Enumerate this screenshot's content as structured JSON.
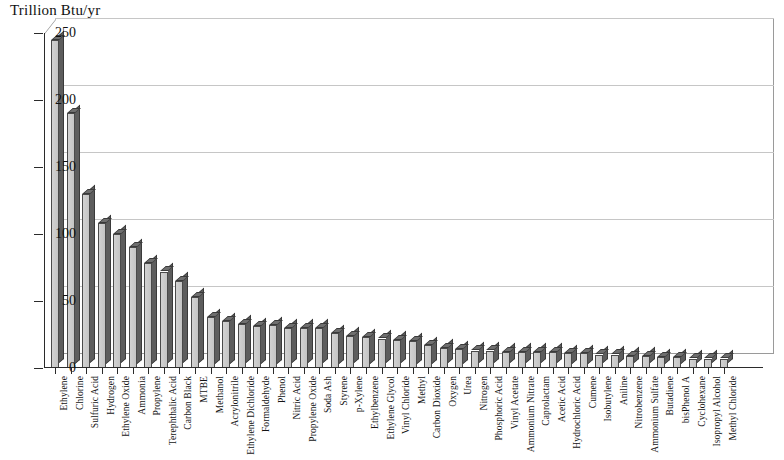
{
  "chart_data": {
    "type": "bar",
    "title": "",
    "ylabel": "Trillion Btu/yr",
    "xlabel": "",
    "ylim": [
      0,
      250
    ],
    "yticks": [
      0,
      50,
      100,
      150,
      200,
      250
    ],
    "grid": true,
    "legend": "none",
    "categories": [
      "Ethylene",
      "Chlorine",
      "Sulfuric Acid",
      "Hydrogen",
      "Ethylene Oxide",
      "Ammonia",
      "Propylene",
      "Terephthalic Acid",
      "Carbon Black",
      "MTBE",
      "Methanol",
      "Acrylonitrile",
      "Ethylene Dichloride",
      "Formaldehyde",
      "Phenol",
      "Nitric Acid",
      "Propylene Oxide",
      "Soda Ash",
      "Styrene",
      "p-Xylene",
      "Ethylbenzene",
      "Ethylene Glycol",
      "Vinyl Chloride",
      "Methyl",
      "Carbon Dioxide",
      "Oxygen",
      "Urea",
      "Nitrogen",
      "Phosphoric Acid",
      "Vinyl Acetate",
      "Ammonium Nitrate",
      "Caprolactam",
      "Acetic Acid",
      "Hydrochloric Acid",
      "Cumene",
      "Isobutylene",
      "Aniline",
      "Nitrobenzene",
      "Ammonium Sulfate",
      "Butadiene",
      "bisPhenol A",
      "Cyclohexane",
      "Isopropyl Alcohol",
      "Methyl Chloride"
    ],
    "values": [
      245,
      190,
      130,
      108,
      100,
      90,
      78,
      72,
      65,
      53,
      38,
      35,
      33,
      31,
      32,
      30,
      30,
      30,
      26,
      24,
      23,
      22,
      21,
      20,
      17,
      15,
      14,
      13,
      13,
      12,
      12,
      12,
      12,
      11,
      11,
      10,
      10,
      9,
      9,
      8,
      8,
      7,
      7,
      7
    ],
    "units": "Trillion Btu/yr",
    "bar_face_color": "#c9c9c9",
    "bar_side_color": "#5d5d5d",
    "grid_color": "#c6c6c6",
    "axis_color": "#2b2b2b",
    "background_color": "#ffffff"
  },
  "axis": {
    "y_title": "Trillion Btu/yr"
  }
}
